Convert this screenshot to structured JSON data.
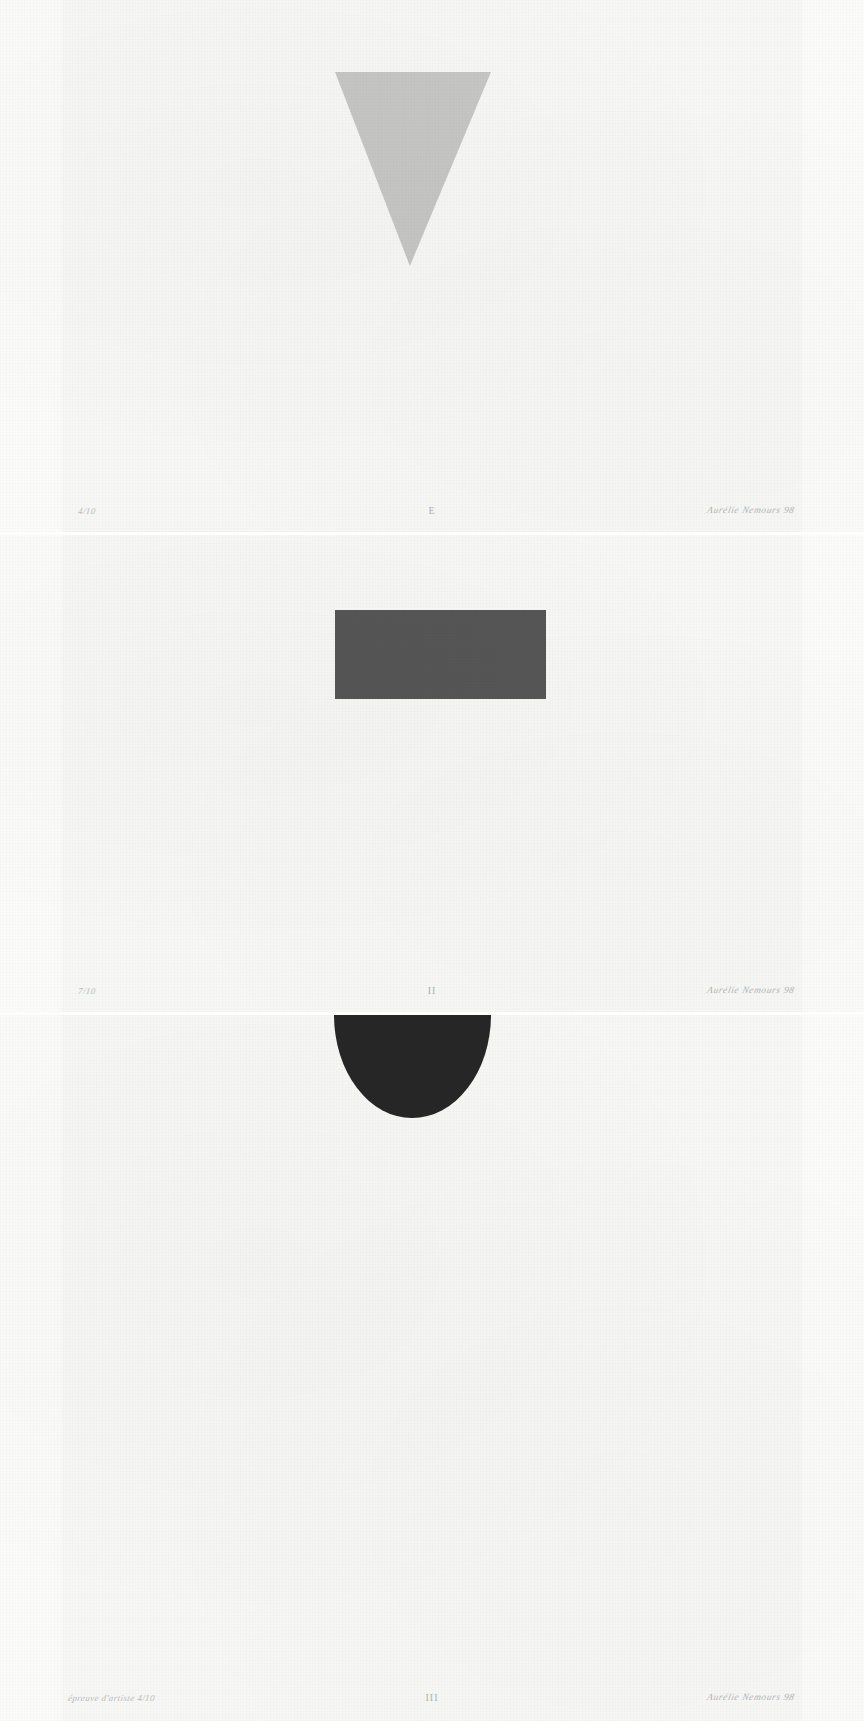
{
  "artwork": {
    "title": "Geometric Triptych",
    "sheet_color": "#f7f7f6",
    "background_color": "#ffffff"
  },
  "panels": [
    {
      "id": "panel-1",
      "shape_name": "inverted-triangle",
      "shape_color": "#c6c6c5",
      "shape_description": "inverted triangle",
      "annotations": {
        "edition": "4/10",
        "numeral": "E",
        "signature": "Aurélie Nemours 98"
      }
    },
    {
      "id": "panel-2",
      "shape_name": "rectangle",
      "shape_color": "#565657",
      "shape_description": "horizontal rectangle",
      "annotations": {
        "edition": "7/10",
        "numeral": "II",
        "signature": "Aurélie Nemours 98"
      }
    },
    {
      "id": "panel-3",
      "shape_name": "half-disc",
      "shape_color": "#262626",
      "shape_description": "half disc with flat top edge",
      "annotations": {
        "edition": "épreuve d'artiste  4/10",
        "numeral": "III",
        "signature": "Aurélie Nemours 98"
      }
    }
  ]
}
